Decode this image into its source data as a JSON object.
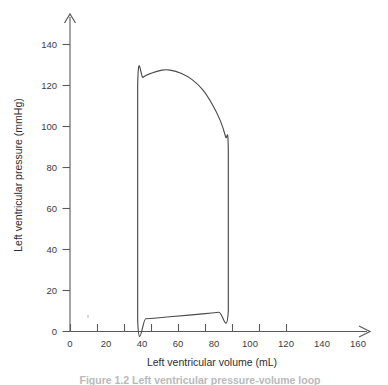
{
  "figure": {
    "background_color": "#ffffff",
    "line_color": "#4a4a4a",
    "axis_color": "#5a5a5a",
    "caption": "Figure 1.2  Left ventricular pressure-volume loop"
  },
  "chart_data": {
    "type": "line",
    "title": "",
    "subtitle": "",
    "xlabel": "Left ventricular volume (mL)",
    "ylabel": "Left ventricular pressure (mmHg)",
    "xlim": [
      0,
      175
    ],
    "ylim": [
      0,
      150
    ],
    "xticks": [
      0,
      20,
      40,
      60,
      80,
      100,
      120,
      140,
      160
    ],
    "xtick_labels": [
      "0",
      "20",
      "40",
      "60",
      "80",
      "100",
      "120",
      "140",
      "160"
    ],
    "yticks": [
      0,
      20,
      40,
      60,
      80,
      100,
      120,
      140
    ],
    "ytick_labels": [
      "0",
      "20",
      "40",
      "60",
      "80",
      "100",
      "120",
      "140"
    ],
    "grid": false,
    "legend": null,
    "legend_position": "none",
    "axis_arrows": {
      "x": true,
      "y": true
    },
    "series": [
      {
        "name": "Left ventricular pressure-volume loop",
        "closed": true,
        "points": [
          {
            "volume": 50,
            "pressure": 6
          },
          {
            "volume": 50,
            "pressure": 120
          },
          {
            "volume": 54,
            "pressure": 124
          },
          {
            "volume": 60,
            "pressure": 126
          },
          {
            "volume": 68,
            "pressure": 127.5
          },
          {
            "volume": 74,
            "pressure": 127.5
          },
          {
            "volume": 82,
            "pressure": 126
          },
          {
            "volume": 90,
            "pressure": 123
          },
          {
            "volume": 98,
            "pressure": 118
          },
          {
            "volume": 105,
            "pressure": 111
          },
          {
            "volume": 111,
            "pressure": 103
          },
          {
            "volume": 115,
            "pressure": 95
          },
          {
            "volume": 117,
            "pressure": 88
          },
          {
            "volume": 117,
            "pressure": 10
          },
          {
            "volume": 110,
            "pressure": 9.4
          },
          {
            "volume": 100,
            "pressure": 8.7
          },
          {
            "volume": 88,
            "pressure": 8
          },
          {
            "volume": 76,
            "pressure": 7.3
          },
          {
            "volume": 64,
            "pressure": 6.6
          },
          {
            "volume": 56,
            "pressure": 6.2
          },
          {
            "volume": 50,
            "pressure": 6
          }
        ],
        "annotations": {
          "end_systolic_volume_mL": 50,
          "end_diastolic_volume_mL": 117,
          "peak_systolic_pressure_mmHg": 127.5,
          "aortic_valve_open_pressure_mmHg": 120,
          "aortic_valve_close_pressure_mmHg": 88,
          "end_diastolic_pressure_mmHg": 10,
          "minimum_pressure_mmHg": 6,
          "stroke_volume_mL": 67
        }
      }
    ]
  }
}
